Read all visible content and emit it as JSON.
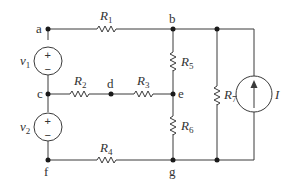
{
  "diagram": {
    "type": "circuit-schematic",
    "nodes": [
      {
        "id": "a",
        "label": "a"
      },
      {
        "id": "b",
        "label": "b"
      },
      {
        "id": "c",
        "label": "c"
      },
      {
        "id": "d",
        "label": "d"
      },
      {
        "id": "e",
        "label": "e"
      },
      {
        "id": "f",
        "label": "f"
      },
      {
        "id": "g",
        "label": "g"
      }
    ],
    "components": [
      {
        "id": "R1",
        "kind": "resistor",
        "label": "R",
        "sub": "1",
        "between": [
          "a",
          "b"
        ]
      },
      {
        "id": "R2",
        "kind": "resistor",
        "label": "R",
        "sub": "2",
        "between": [
          "c",
          "d"
        ]
      },
      {
        "id": "R3",
        "kind": "resistor",
        "label": "R",
        "sub": "3",
        "between": [
          "d",
          "e"
        ]
      },
      {
        "id": "R4",
        "kind": "resistor",
        "label": "R",
        "sub": "4",
        "between": [
          "f",
          "g"
        ]
      },
      {
        "id": "R5",
        "kind": "resistor",
        "label": "R",
        "sub": "5",
        "between": [
          "b",
          "e"
        ]
      },
      {
        "id": "R6",
        "kind": "resistor",
        "label": "R",
        "sub": "6",
        "between": [
          "e",
          "g"
        ]
      },
      {
        "id": "R7",
        "kind": "resistor",
        "label": "R",
        "sub": "7",
        "between": [
          "b",
          "g"
        ]
      },
      {
        "id": "v1",
        "kind": "voltage-source",
        "label": "v",
        "sub": "1",
        "plus": "a",
        "minus": "c",
        "plus_sign": "+",
        "minus_sign": "−"
      },
      {
        "id": "v2",
        "kind": "voltage-source",
        "label": "v",
        "sub": "2",
        "plus": "c",
        "minus": "f",
        "plus_sign": "+",
        "minus_sign": "−"
      },
      {
        "id": "I",
        "kind": "current-source",
        "label": "I",
        "direction": "up",
        "between": [
          "g",
          "b"
        ]
      }
    ],
    "colors": {
      "wire": "#3a3a3a",
      "node": "#1a1a1a",
      "text": "#333333",
      "background": "#ffffff"
    }
  }
}
